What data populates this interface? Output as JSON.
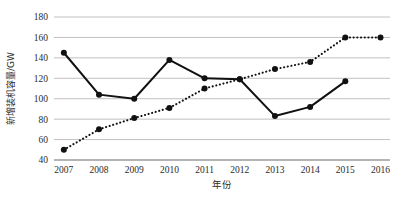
{
  "chart_data": {
    "type": "line",
    "title": "",
    "xlabel": "年份",
    "ylabel": "新增装机容量/GW",
    "categories": [
      "2007",
      "2008",
      "2009",
      "2010",
      "2011",
      "2012",
      "2013",
      "2014",
      "2015",
      "2016"
    ],
    "yticks": [
      "40",
      "60",
      "80",
      "100",
      "120",
      "140",
      "160",
      "180"
    ],
    "ylim": [
      40,
      180
    ],
    "grid": true,
    "legend": "none",
    "series": [
      {
        "name": "solid-series",
        "style": "solid",
        "color": "#111111",
        "marker": "circle",
        "x": [
          "2007",
          "2008",
          "2009",
          "2010",
          "2011",
          "2012",
          "2013",
          "2014",
          "2015"
        ],
        "values": [
          145,
          104,
          100,
          138,
          120,
          119,
          83,
          92,
          117
        ]
      },
      {
        "name": "dotted-series",
        "style": "dotted",
        "color": "#111111",
        "marker": "circle",
        "x": [
          "2007",
          "2008",
          "2009",
          "2010",
          "2011",
          "2012",
          "2013",
          "2014",
          "2015",
          "2016"
        ],
        "values": [
          50,
          70,
          81,
          91,
          110,
          119,
          129,
          136,
          160,
          160
        ]
      }
    ]
  },
  "axes": {
    "y_title": "新增装机容量/GW",
    "x_title": "年份"
  }
}
